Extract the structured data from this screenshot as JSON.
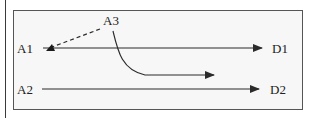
{
  "diagram": {
    "nodes": {
      "a1": {
        "label": "A1"
      },
      "a2": {
        "label": "A2"
      },
      "a3": {
        "label": "A3"
      },
      "d1": {
        "label": "D1"
      },
      "d2": {
        "label": "D2"
      }
    },
    "edges": [
      {
        "from": "A1",
        "to": "D1",
        "style": "solid",
        "shape": "straight"
      },
      {
        "from": "A2",
        "to": "D2",
        "style": "solid",
        "shape": "straight"
      },
      {
        "from": "A3",
        "to": "A1",
        "style": "dashed",
        "shape": "straight"
      },
      {
        "from": "A3",
        "to": "(open)",
        "style": "solid",
        "shape": "curved"
      }
    ],
    "colors": {
      "line": "#2b2b2b",
      "frame_border": "#555555",
      "frame_fill": "#f7f7f7",
      "text": "#222222"
    }
  }
}
